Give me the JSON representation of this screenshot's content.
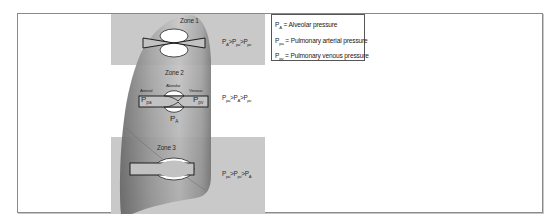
{
  "figure": {
    "colors": {
      "zone_band": "#c9c9c9",
      "lung_fill_light": "#d2d2d2",
      "lung_fill_dark": "#8e8e8e",
      "frame": "#8a8a8a",
      "vessel_outline": "#1e1e1e",
      "vessel_fill": "#c2c2c2",
      "alveolus_fill": "#ffffff"
    }
  },
  "legend": {
    "items": [
      {
        "symbol": "P",
        "sub": "A",
        "text": "= Alveolar pressure"
      },
      {
        "symbol": "P",
        "sub": "pa",
        "text": "= Pulmonary arterial pressure"
      },
      {
        "symbol": "P",
        "sub": "pv",
        "text": "= Pulmonary venous pressure"
      }
    ]
  },
  "zones": [
    {
      "title": "Zone 1",
      "relation": [
        {
          "p": "P",
          "sub": "A",
          "op": ">"
        },
        {
          "p": "P",
          "sub": "pa",
          "op": ">"
        },
        {
          "p": "P",
          "sub": "pv",
          "op": ""
        }
      ]
    },
    {
      "title": "Zone 2",
      "relation": [
        {
          "p": "P",
          "sub": "pa",
          "op": ">"
        },
        {
          "p": "P",
          "sub": "A",
          "op": ">"
        },
        {
          "p": "P",
          "sub": "pv",
          "op": ""
        }
      ],
      "labels": {
        "arterial": "Arterial",
        "alveolar": "Alveolar",
        "venous": "Venous",
        "p_arterial": {
          "p": "P",
          "sub": "pa"
        },
        "p_venous": {
          "p": "P",
          "sub": "pv"
        },
        "p_alveolar": {
          "p": "P",
          "sub": "A"
        }
      }
    },
    {
      "title": "Zone 3",
      "relation": [
        {
          "p": "P",
          "sub": "pa",
          "op": ">"
        },
        {
          "p": "P",
          "sub": "pv",
          "op": ">"
        },
        {
          "p": "P",
          "sub": "A",
          "op": ""
        }
      ]
    }
  ]
}
